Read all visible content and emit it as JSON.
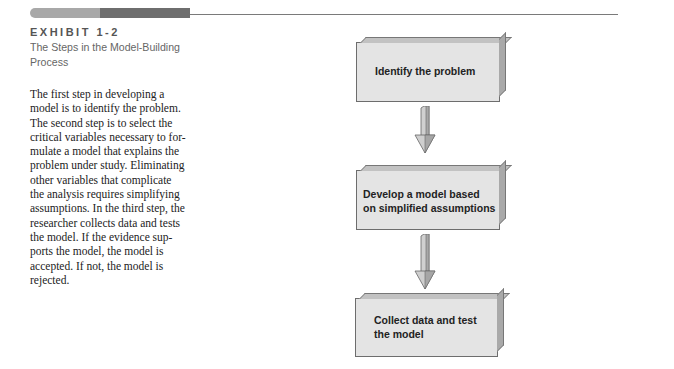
{
  "exhibit": {
    "number": "EXHIBIT 1-2",
    "title": "The Steps in the Model-Building Process",
    "caption": "The first step in developing a model is to identify the problem. The second step is to select the critical variables necessary to formulate a model that explains the problem under study. Eliminating other variables that complicate the analysis requires simplifying assumptions. In the third step, the researcher collects data and tests the model. If the evidence supports the model, the model is accepted. If not, the model is rejected."
  },
  "caption_lines": [
    "The first step in developing a",
    "model is to identify the problem.",
    "The second step is to select the",
    "critical variables necessary to for-",
    "mulate a model that explains the",
    "problem under study. Eliminating",
    "other variables that complicate",
    "the analysis requires simplifying",
    "assumptions. In the third step, the",
    "researcher collects data and tests",
    "the model. If the evidence sup-",
    "ports the model, the model is",
    "accepted. If not, the model is",
    "rejected."
  ],
  "flowchart": {
    "steps": [
      {
        "line1": "Identify the problem",
        "line2": ""
      },
      {
        "line1": "Develop a model based",
        "line2": "on simplified assumptions"
      },
      {
        "line1": "Collect data and test",
        "line2": "the model"
      }
    ],
    "connectors": [
      "down-arrow",
      "down-arrow"
    ]
  },
  "colors": {
    "box_face": "#e4e4e4",
    "box_top": "#c2c2c2",
    "box_side": "#a9a9a9",
    "rule": "#7a7a7a"
  }
}
